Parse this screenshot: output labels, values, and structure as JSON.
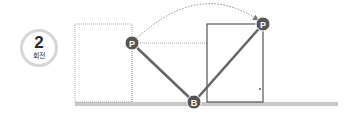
{
  "badge": {
    "number": "2",
    "label": "회전"
  },
  "points": {
    "p_start": {
      "label": "P",
      "x": 132,
      "y": 43
    },
    "p_end": {
      "label": "P",
      "x": 263,
      "y": 24
    },
    "b": {
      "label": "B",
      "x": 194,
      "y": 102
    }
  },
  "colors": {
    "line": "#666666",
    "point_fill": "#555555",
    "dotted": "#9a9a9a",
    "ground": "#c8c8c8",
    "badge_ring": "#d6d6d6"
  }
}
